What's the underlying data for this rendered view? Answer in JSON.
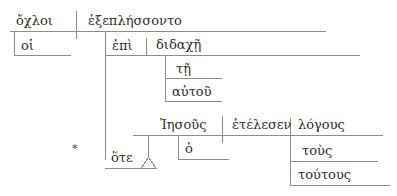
{
  "diagram": {
    "type": "greek-sentence-diagram",
    "style": "reed-kellogg",
    "line_color": "#8c8c8c",
    "text_color": "#2d2d2d",
    "background": "#ffffff",
    "main_clause": {
      "subject": "ὄχλοι",
      "subject_article": "οἱ",
      "verb": "ἐξεπλήσσοντο"
    },
    "prepositional_phrase": {
      "preposition": "ἐπὶ",
      "object": "διδαχῇ",
      "object_article": "τῇ",
      "object_modifier": "αὐτοῦ"
    },
    "subordinate_clause": {
      "conjunction": "ὅτε",
      "subject": "Ἰησοῦς",
      "subject_article": "ὁ",
      "verb": "ἐτέλεσεν",
      "object": "λόγους",
      "object_article": "τοὺς",
      "object_modifier": "τούτους"
    },
    "markers": {
      "asterisk": "*"
    }
  }
}
